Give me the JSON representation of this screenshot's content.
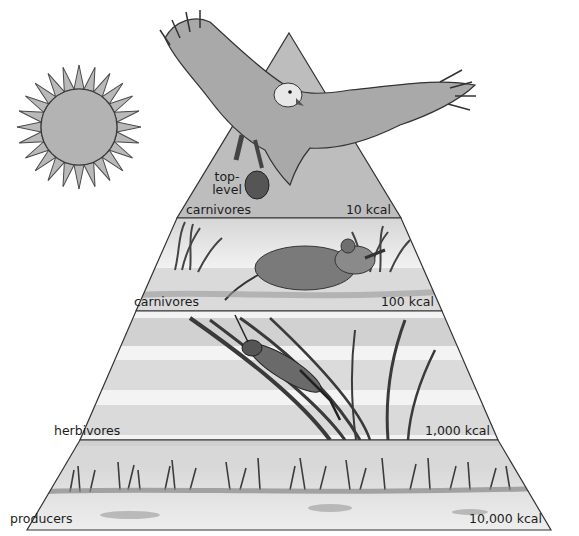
{
  "diagram": {
    "type": "energy-pyramid",
    "sun": {
      "icon": "sun-icon",
      "description": "sun with triangular rays"
    },
    "levels": [
      {
        "name": "top-level carnivores",
        "label_lines": [
          "top-",
          "level",
          "carnivores"
        ],
        "energy": "10 kcal",
        "illustration": "hawk carrying mouse"
      },
      {
        "name": "carnivores",
        "label": "carnivores",
        "energy": "100 kcal",
        "illustration": "mouse eating grasshopper in grass"
      },
      {
        "name": "herbivores",
        "label": "herbivores",
        "energy": "1,000 kcal",
        "illustration": "grasshopper on grass blades"
      },
      {
        "name": "producers",
        "label": "producers",
        "energy": "10,000 kcal",
        "illustration": "grassland plants"
      }
    ],
    "colors": {
      "pyramid_fill": "#bdbdbd",
      "outline": "#333333",
      "text": "#1c1c1c"
    }
  }
}
